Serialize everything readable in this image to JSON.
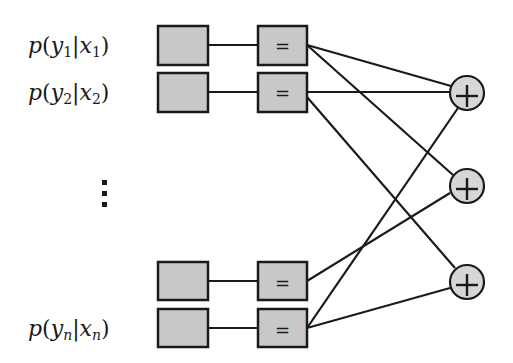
{
  "diagram": {
    "type": "factor-graph",
    "colors": {
      "stroke": "#1a1a1a",
      "box_fill": "#c8c8c8",
      "circle_fill": "#d6d6d6",
      "background": "#ffffff"
    },
    "rows": [
      {
        "id": "row-1",
        "label": {
          "p": "p",
          "y": "y",
          "ysub": "1",
          "x": "x",
          "xsub": "1"
        },
        "y": 45,
        "equals_symbol": "="
      },
      {
        "id": "row-2",
        "label": {
          "p": "p",
          "y": "y",
          "ysub": "2",
          "x": "x",
          "xsub": "2"
        },
        "y": 92,
        "equals_symbol": "="
      },
      {
        "id": "row-n-minus-1",
        "label": null,
        "y": 281,
        "equals_symbol": "="
      },
      {
        "id": "row-n",
        "label": {
          "p": "p",
          "y": "y",
          "ysub": "n",
          "x": "x",
          "xsub": "n"
        },
        "y": 328,
        "equals_symbol": "="
      }
    ],
    "ellipsis": "⋮",
    "check_nodes": [
      {
        "id": "check-1",
        "symbol": "+",
        "cx": 467,
        "cy": 93
      },
      {
        "id": "check-2",
        "symbol": "+",
        "cx": 467,
        "cy": 186
      },
      {
        "id": "check-3",
        "symbol": "+",
        "cx": 467,
        "cy": 282
      }
    ],
    "edges": [
      {
        "from": "row-1",
        "to": "check-1"
      },
      {
        "from": "row-1",
        "to": "check-2"
      },
      {
        "from": "row-2",
        "to": "check-1"
      },
      {
        "from": "row-2",
        "to": "check-3"
      },
      {
        "from": "row-n-minus-1",
        "to": "check-2"
      },
      {
        "from": "row-n",
        "to": "check-1"
      },
      {
        "from": "row-n",
        "to": "check-3"
      }
    ]
  }
}
